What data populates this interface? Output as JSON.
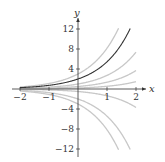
{
  "chart_data": {
    "type": "line",
    "title": "",
    "xlabel": "x",
    "ylabel": "y",
    "xlim": [
      -2,
      2.2
    ],
    "ylim": [
      -13,
      13.5
    ],
    "x_ticks": [
      -2,
      -1,
      1,
      2
    ],
    "x_tick_labels": [
      "−2",
      "−1",
      "1",
      "2"
    ],
    "y_ticks": [
      12,
      8,
      4,
      -4,
      -8,
      -12
    ],
    "y_tick_labels": [
      "12",
      "8",
      "4",
      "−4",
      "−8",
      "−12"
    ],
    "grid": false,
    "legend": null,
    "series": [
      {
        "name": "y = 3e^x",
        "C": 3,
        "color": "#c8c8c8",
        "highlight": false
      },
      {
        "name": "y = 2e^x",
        "C": 2,
        "color": "#333333",
        "highlight": true
      },
      {
        "name": "y = e^x",
        "C": 1,
        "color": "#c8c8c8",
        "highlight": false
      },
      {
        "name": "y = 0.5e^x",
        "C": 0.5,
        "color": "#c8c8c8",
        "highlight": false
      },
      {
        "name": "y = 0.2e^x",
        "C": 0.2,
        "color": "#c8c8c8",
        "highlight": false
      },
      {
        "name": "y = -0.5e^x",
        "C": -0.5,
        "color": "#c8c8c8",
        "highlight": false
      },
      {
        "name": "y = -2e^x",
        "C": -2,
        "color": "#c8c8c8",
        "highlight": false
      },
      {
        "name": "y = -3e^x",
        "C": -3,
        "color": "#c8c8c8",
        "highlight": false
      }
    ]
  },
  "axes": {
    "x_label": "x",
    "y_label": "y"
  }
}
